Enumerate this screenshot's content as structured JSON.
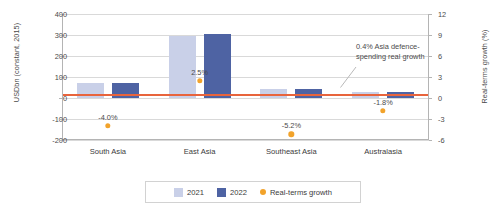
{
  "chart_data": {
    "type": "bar",
    "title": "",
    "categories": [
      "South Asia",
      "East Asia",
      "Southeast Asia",
      "Australasia"
    ],
    "series": [
      {
        "name": "2021",
        "values": [
          72,
          295,
          45,
          30
        ]
      },
      {
        "name": "2022",
        "values": [
          70,
          305,
          43,
          31
        ]
      }
    ],
    "growth": {
      "name": "Real-terms growth",
      "values": [
        -4.0,
        2.5,
        -5.2,
        -1.8
      ],
      "labels": [
        "-4.0%",
        "2.5%",
        "-5.2%",
        "-1.8%"
      ]
    },
    "reference_line": {
      "value": 0.4,
      "axis": "right"
    },
    "xlabel": "",
    "ylabel": "USDbn (constant, 2015)",
    "ylabel_right": "Real-terms growth (%)",
    "ylim": [
      -200,
      400
    ],
    "ylim_right": [
      -6,
      12
    ],
    "yticks": [
      400,
      300,
      200,
      100,
      0,
      -100,
      -200
    ],
    "ytick_labels": [
      "400",
      "300",
      "200",
      "100",
      "0",
      "-100",
      "-200"
    ],
    "yticks_right": [
      12,
      9,
      6,
      3,
      0,
      -3,
      -6
    ],
    "ytick_labels_right": [
      "12",
      "9",
      "6",
      "3",
      "0",
      "-3",
      "-6"
    ],
    "grid": true,
    "legend_position": "bottom"
  },
  "annotation": {
    "text": "0.4% Asia defence-spending real growth"
  },
  "legend": {
    "items": [
      {
        "label": "2021"
      },
      {
        "label": "2022"
      },
      {
        "label": "Real-terms growth"
      }
    ]
  },
  "colors": {
    "bar_2021": "#c9d0e8",
    "bar_2022": "#4e63a3",
    "growth_dot": "#f2a32b",
    "reference_line": "#e8643c",
    "gridline": "#d9d9d9"
  }
}
